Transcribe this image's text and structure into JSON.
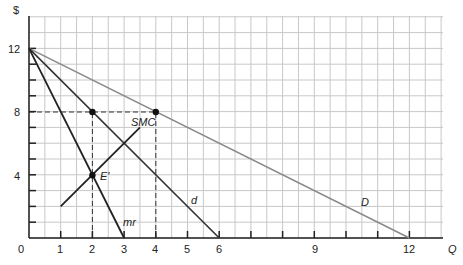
{
  "chart_data": {
    "type": "line",
    "title": "",
    "xlabel": "Q",
    "ylabel": "$",
    "xlim": [
      0,
      13
    ],
    "ylim": [
      0,
      14
    ],
    "grid": true,
    "x_tick_labels": [
      "0",
      "1",
      "2",
      "3",
      "4",
      "5",
      "6",
      "9",
      "12"
    ],
    "x_tick_values": [
      0,
      1,
      2,
      3,
      4,
      5,
      6,
      9,
      12
    ],
    "y_tick_labels": [
      "4",
      "8",
      "12"
    ],
    "y_tick_values": [
      4,
      8,
      12
    ],
    "series": [
      {
        "name": "D",
        "points": [
          [
            0,
            12
          ],
          [
            12,
            0
          ]
        ],
        "color": "#8a8a8a"
      },
      {
        "name": "d",
        "points": [
          [
            0,
            12
          ],
          [
            6,
            0
          ]
        ],
        "color": "#333333"
      },
      {
        "name": "mr",
        "points": [
          [
            0,
            12
          ],
          [
            3,
            0
          ]
        ],
        "color": "#222222"
      },
      {
        "name": "SMC",
        "points": [
          [
            1,
            2
          ],
          [
            3.5,
            7
          ]
        ],
        "color": "#222222"
      }
    ],
    "points": [
      {
        "label": "",
        "x": 2,
        "y": 8
      },
      {
        "label": "",
        "x": 4,
        "y": 8
      },
      {
        "label": "E'",
        "x": 2,
        "y": 4
      }
    ],
    "dashed_guides": [
      {
        "from": [
          0,
          8
        ],
        "to": [
          4,
          8
        ]
      },
      {
        "from": [
          2,
          0
        ],
        "to": [
          2,
          8
        ]
      },
      {
        "from": [
          4,
          0
        ],
        "to": [
          4,
          8
        ]
      }
    ]
  },
  "labels": {
    "y_axis": "$",
    "x_axis": "Q",
    "D": "D",
    "d": "d",
    "mr": "mr",
    "SMC": "SMC",
    "E": "E'",
    "origin": "0",
    "x1": "1",
    "x2": "2",
    "x3": "3",
    "x4": "4",
    "x5": "5",
    "x6": "6",
    "x9": "9",
    "x12": "12",
    "y4": "4",
    "y8": "8",
    "y12": "12"
  }
}
